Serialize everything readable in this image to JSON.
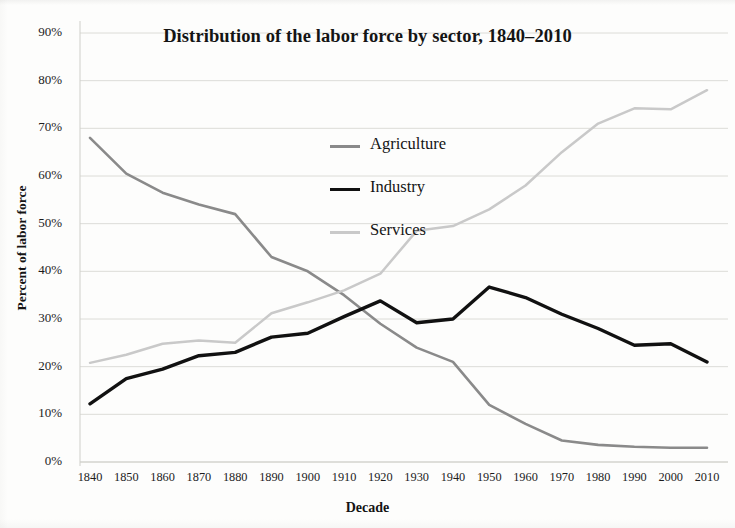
{
  "chart_data": {
    "type": "line",
    "title": "Distribution of the labor force by sector, 1840–2010",
    "xlabel": "Decade",
    "ylabel": "Percent of labor force",
    "categories": [
      "1840",
      "1850",
      "1860",
      "1870",
      "1880",
      "1890",
      "1900",
      "1910",
      "1920",
      "1930",
      "1940",
      "1950",
      "1960",
      "1970",
      "1980",
      "1990",
      "2000",
      "2010"
    ],
    "x": [
      1840,
      1850,
      1860,
      1870,
      1880,
      1890,
      1900,
      1910,
      1920,
      1930,
      1940,
      1950,
      1960,
      1970,
      1980,
      1990,
      2000,
      2010
    ],
    "ylim": [
      0,
      90
    ],
    "ytick_labels": [
      "0%",
      "10%",
      "20%",
      "30%",
      "40%",
      "50%",
      "60%",
      "70%",
      "80%",
      "90%"
    ],
    "ytick_values": [
      0,
      10,
      20,
      30,
      40,
      50,
      60,
      70,
      80,
      90
    ],
    "grid": true,
    "legend_position": "center-left-inside",
    "series": [
      {
        "name": "Agriculture",
        "color": "#8a8a8a",
        "width": 2.6,
        "values": [
          68.0,
          60.5,
          56.5,
          54.0,
          52.0,
          43.0,
          40.0,
          35.0,
          29.0,
          24.0,
          21.0,
          12.0,
          8.0,
          4.5,
          3.6,
          3.2,
          3.0,
          3.0
        ]
      },
      {
        "name": "Industry",
        "color": "#111111",
        "width": 3.4,
        "values": [
          12.2,
          17.5,
          19.5,
          22.3,
          23.0,
          26.2,
          27.0,
          30.5,
          33.8,
          29.2,
          30.0,
          36.7,
          34.5,
          31.0,
          28.0,
          24.5,
          24.8,
          21.0
        ]
      },
      {
        "name": "Services",
        "color": "#c9c9c9",
        "width": 2.5,
        "values": [
          20.8,
          22.5,
          24.8,
          25.5,
          25.0,
          31.2,
          33.5,
          36.0,
          39.5,
          48.5,
          49.5,
          53.0,
          58.0,
          65.0,
          71.0,
          74.2,
          74.0,
          78.0
        ]
      }
    ],
    "legend": [
      {
        "label": "Agriculture"
      },
      {
        "label": "Industry"
      },
      {
        "label": "Services"
      }
    ]
  }
}
